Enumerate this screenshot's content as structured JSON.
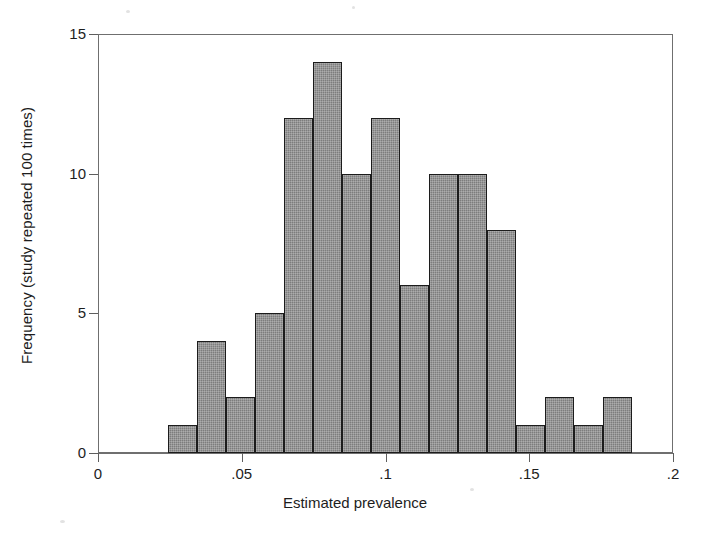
{
  "chart_data": {
    "type": "bar",
    "subtype": "histogram",
    "title": "",
    "xlabel": "Estimated prevalence",
    "ylabel": "Frequency (study repeated 100 times)",
    "xlim": [
      0,
      0.2
    ],
    "ylim": [
      0,
      15
    ],
    "xticks": [
      0,
      0.05,
      0.1,
      0.15,
      0.2
    ],
    "xtick_labels": [
      "0",
      ".05",
      ".1",
      ".15",
      ".2"
    ],
    "yticks": [
      0,
      5,
      10,
      15
    ],
    "ytick_labels": [
      "0",
      "5",
      "10",
      "15"
    ],
    "grid": false,
    "legend": null,
    "bar_color": "#7d7d7d",
    "bar_edge_color": "#1c1c1c",
    "bin_width": 0.0101,
    "bin_start": 0.0243,
    "categories": [
      "0.024-0.034",
      "0.034-0.044",
      "0.044-0.055",
      "0.055-0.065",
      "0.065-0.075",
      "0.075-0.085",
      "0.085-0.095",
      "0.095-0.105",
      "0.105-0.115",
      "0.115-0.125",
      "0.125-0.136",
      "0.136-0.146",
      "0.146-0.156",
      "0.156-0.166",
      "0.166-0.176",
      "0.176-0.186"
    ],
    "bin_centers": [
      0.029,
      0.039,
      0.05,
      0.06,
      0.07,
      0.08,
      0.09,
      0.1,
      0.11,
      0.12,
      0.131,
      0.141,
      0.151,
      0.161,
      0.171,
      0.181
    ],
    "values": [
      1,
      4,
      2,
      5,
      12,
      14,
      10,
      12,
      6,
      10,
      10,
      8,
      1,
      2,
      1,
      2
    ],
    "total_count": 100
  },
  "axes": {
    "x_title": "Estimated prevalence",
    "y_title": "Frequency (study repeated 100 times)"
  }
}
